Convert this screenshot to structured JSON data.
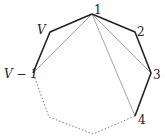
{
  "diagram": {
    "type": "polygon-triangulation-fan",
    "vertices": [
      {
        "id": "1",
        "label": "1",
        "x": 92,
        "y": 14
      },
      {
        "id": "2",
        "label": "2",
        "x": 135,
        "y": 32
      },
      {
        "id": "3",
        "label": "3",
        "x": 151,
        "y": 73
      },
      {
        "id": "4",
        "label": "4",
        "x": 135,
        "y": 116
      },
      {
        "id": "b1",
        "label": "",
        "x": 93,
        "y": 134
      },
      {
        "id": "b2",
        "label": "",
        "x": 49,
        "y": 117
      },
      {
        "id": "Vm1",
        "label": "V − 1",
        "x": 33,
        "y": 73
      },
      {
        "id": "V",
        "label": "V",
        "x": 50,
        "y": 32
      }
    ],
    "labels": {
      "v1": "1",
      "v2": "2",
      "v3": "3",
      "v4": "4",
      "vV": "V",
      "vVm1": "V − 1"
    },
    "solid_edges": [
      "V-1",
      "1-2",
      "2-3",
      "3-4",
      "Vm1-V"
    ],
    "dotted_edges": [
      "4-b1",
      "b1-b2",
      "b2-Vm1"
    ],
    "diagonals": [
      "1-3",
      "1-4",
      "1-Vm1"
    ],
    "colors": {
      "edge": "#222222",
      "diagonal": "#999999",
      "dotted": "#777777"
    }
  }
}
